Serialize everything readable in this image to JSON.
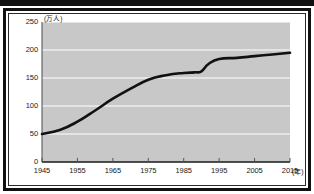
{
  "chart_data": {
    "type": "line",
    "title": "",
    "subtitle": "",
    "xlabel": "(年)",
    "ylabel": "(万人)",
    "unit_y": "(万人)",
    "unit_x": "(年)",
    "xlim": [
      1945,
      2015
    ],
    "ylim": [
      0,
      250
    ],
    "grid": true,
    "grid_color": "#ffffff",
    "plot_background": "#c8c8c8",
    "line_color": "#111111",
    "legend": null,
    "legend_position": "none",
    "y_ticks": [
      0,
      50,
      100,
      150,
      200,
      250
    ],
    "y_tick_labels": [
      "0",
      "50",
      "100",
      "150",
      "200",
      "250"
    ],
    "x_ticks": [
      1945,
      1955,
      1965,
      1975,
      1985,
      1995,
      2005,
      2015
    ],
    "x_tick_labels": [
      "1945",
      "1955",
      "1965",
      "1975",
      "1985",
      "1995",
      "2005",
      "2015"
    ],
    "series": [
      {
        "name": "",
        "x": [
          1945,
          1950,
          1955,
          1960,
          1965,
          1970,
          1975,
          1980,
          1985,
          1988,
          1990,
          1992,
          1995,
          2000,
          2005,
          2010,
          2015
        ],
        "values": [
          50,
          57,
          72,
          92,
          113,
          131,
          147,
          155,
          159,
          160,
          162,
          175,
          184,
          186,
          189,
          192,
          195
        ]
      }
    ],
    "annotations": []
  }
}
